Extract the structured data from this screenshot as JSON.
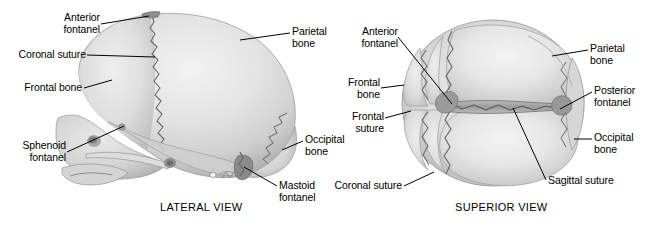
{
  "figure": {
    "background_color": "#ffffff",
    "ink_color": "#000000",
    "bone_light": "#efefef",
    "bone_mid": "#d9d9d9",
    "bone_shadow": "#b4b4b4",
    "suture_color": "#6e6e6e"
  },
  "panels": [
    {
      "id": "lateral",
      "caption": "LATERAL VIEW",
      "labels": [
        {
          "id": "anterior-fontanel",
          "text": "Anterior\nfontanel",
          "align": "right"
        },
        {
          "id": "coronal-suture",
          "text": "Coronal suture",
          "align": "right"
        },
        {
          "id": "frontal-bone",
          "text": "Frontal bone",
          "align": "right"
        },
        {
          "id": "sphenoid-fontanel",
          "text": "Sphenoid\nfontanel",
          "align": "right"
        },
        {
          "id": "parietal-bone",
          "text": "Parietal\nbone",
          "align": "left"
        },
        {
          "id": "occipital-bone",
          "text": "Occipital\nbone",
          "align": "left"
        },
        {
          "id": "mastoid-fontanel",
          "text": "Mastoid\nfontanel",
          "align": "left"
        }
      ]
    },
    {
      "id": "superior",
      "caption": "SUPERIOR VIEW",
      "labels": [
        {
          "id": "anterior-fontanel",
          "text": "Anterior\nfontanel",
          "align": "right"
        },
        {
          "id": "frontal-bone",
          "text": "Frontal\nbone",
          "align": "right"
        },
        {
          "id": "frontal-suture",
          "text": "Frontal\nsuture",
          "align": "right"
        },
        {
          "id": "coronal-suture",
          "text": "Coronal suture",
          "align": "right"
        },
        {
          "id": "parietal-bone",
          "text": "Parietal\nbone",
          "align": "left"
        },
        {
          "id": "posterior-fontanel",
          "text": "Posterior\nfontanel",
          "align": "left"
        },
        {
          "id": "occipital-bone",
          "text": "Occipital\nbone",
          "align": "left"
        },
        {
          "id": "sagittal-suture",
          "text": "Sagittal suture",
          "align": "left"
        }
      ]
    }
  ],
  "lateral_labels": {
    "anterior_fontanel": "Anterior\nfontanel",
    "coronal_suture": "Coronal suture",
    "frontal_bone": "Frontal bone",
    "sphenoid_fontanel": "Sphenoid\nfontanel",
    "parietal_bone": "Parietal\nbone",
    "occipital_bone": "Occipital\nbone",
    "mastoid_fontanel": "Mastoid\nfontanel",
    "caption": "LATERAL VIEW"
  },
  "superior_labels": {
    "anterior_fontanel": "Anterior\nfontanel",
    "frontal_bone": "Frontal\nbone",
    "frontal_suture": "Frontal\nsuture",
    "coronal_suture": "Coronal suture",
    "parietal_bone": "Parietal\nbone",
    "posterior_fontanel": "Posterior\nfontanel",
    "occipital_bone": "Occipital\nbone",
    "sagittal_suture": "Sagittal suture",
    "caption": "SUPERIOR VIEW"
  }
}
